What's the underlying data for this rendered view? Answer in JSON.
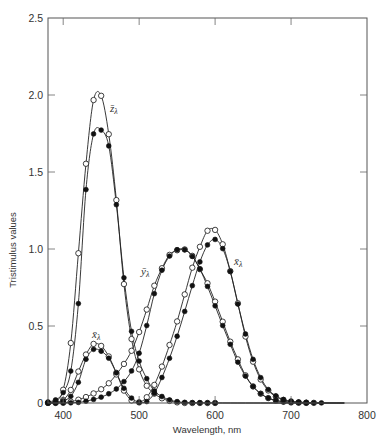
{
  "chart_data": {
    "type": "line",
    "title": "",
    "xlabel": "Wavelength, nm",
    "ylabel": "Tristimulus values",
    "xlim": [
      380,
      800
    ],
    "ylim": [
      0,
      2.5
    ],
    "xticks": [
      400,
      500,
      600,
      700,
      800
    ],
    "xtick_labels": [
      "400",
      "500",
      "600",
      "700",
      "800"
    ],
    "yticks": [
      0,
      0.5,
      1.0,
      1.5,
      2.0,
      2.5
    ],
    "ytick_labels": [
      "0",
      "0.5",
      "1.0",
      "1.5",
      "2.0",
      "2.5"
    ],
    "grid": false,
    "legend": "none (curves labeled inline)",
    "annotations": [
      {
        "text": "z̄λ",
        "x": 462,
        "y": 1.93
      },
      {
        "text": "ȳλ",
        "x": 517,
        "y": 0.95
      },
      {
        "text": "x̄λ",
        "x": 610,
        "y": 0.96
      },
      {
        "text": "x̄λ",
        "x": 444,
        "y": 0.42
      }
    ],
    "x": [
      380,
      390,
      400,
      410,
      420,
      430,
      440,
      450,
      460,
      470,
      480,
      490,
      500,
      510,
      520,
      530,
      540,
      550,
      560,
      570,
      580,
      590,
      600,
      610,
      620,
      630,
      640,
      650,
      660,
      670,
      680,
      690,
      700,
      710,
      720,
      730,
      740,
      750,
      760,
      770
    ],
    "series": [
      {
        "name": "x̄λ (2°, filled markers)",
        "marker": "filled",
        "values": [
          0.0014,
          0.0042,
          0.0143,
          0.0435,
          0.1344,
          0.2839,
          0.3483,
          0.3362,
          0.2908,
          0.1954,
          0.0956,
          0.032,
          0.0049,
          0.0093,
          0.0633,
          0.1655,
          0.2904,
          0.4334,
          0.5945,
          0.7621,
          0.9163,
          1.0263,
          1.0622,
          1.0026,
          0.8544,
          0.6424,
          0.4479,
          0.2835,
          0.1649,
          0.0874,
          0.0468,
          0.0227,
          0.0114,
          0.0058,
          0.0029,
          0.0014,
          0.0007,
          0.0003,
          0.0002,
          0.0001
        ]
      },
      {
        "name": "ȳλ (2°, filled markers)",
        "marker": "filled",
        "values": [
          0.0,
          0.0001,
          0.0004,
          0.0012,
          0.004,
          0.0116,
          0.023,
          0.038,
          0.06,
          0.091,
          0.139,
          0.208,
          0.323,
          0.503,
          0.71,
          0.862,
          0.954,
          0.995,
          0.995,
          0.952,
          0.87,
          0.757,
          0.631,
          0.503,
          0.381,
          0.265,
          0.175,
          0.107,
          0.061,
          0.032,
          0.017,
          0.0082,
          0.0041,
          0.0021,
          0.001,
          0.0005,
          0.0002,
          0.0001,
          0.0001,
          0.0
        ]
      },
      {
        "name": "z̄λ (2°, filled markers)",
        "marker": "filled",
        "values": [
          0.0065,
          0.0201,
          0.0679,
          0.2074,
          0.6456,
          1.3856,
          1.7471,
          1.7721,
          1.6692,
          1.2876,
          0.813,
          0.4652,
          0.272,
          0.1582,
          0.0782,
          0.0422,
          0.0203,
          0.0087,
          0.0039,
          0.0021,
          0.0017,
          0.0011,
          0.0008,
          0.0003,
          0.0002,
          0,
          0,
          0,
          0,
          0,
          0,
          0,
          0,
          0,
          0,
          0,
          0,
          0,
          0,
          0
        ]
      },
      {
        "name": "x̄λ (10°, open markers)",
        "marker": "open",
        "values": [
          0.0002,
          0.0024,
          0.0191,
          0.0847,
          0.2045,
          0.3147,
          0.3837,
          0.3707,
          0.3023,
          0.1956,
          0.0805,
          0.0162,
          0.0038,
          0.0375,
          0.1177,
          0.2365,
          0.3768,
          0.5298,
          0.7052,
          0.8787,
          1.0142,
          1.1185,
          1.124,
          1.0305,
          0.8563,
          0.6475,
          0.4316,
          0.2683,
          0.1526,
          0.0813,
          0.0409,
          0.0199,
          0.0096,
          0.0046,
          0.0022,
          0.001,
          0.0005,
          0.0003,
          0.0001,
          0.0001
        ]
      },
      {
        "name": "ȳλ (10°, open markers)",
        "marker": "open",
        "values": [
          0.0,
          0.0003,
          0.002,
          0.0088,
          0.0214,
          0.0387,
          0.0621,
          0.0895,
          0.1282,
          0.1852,
          0.2536,
          0.3391,
          0.4608,
          0.6067,
          0.7618,
          0.8752,
          0.962,
          0.9918,
          0.9973,
          0.9555,
          0.8689,
          0.7774,
          0.6583,
          0.528,
          0.3981,
          0.2835,
          0.1798,
          0.1076,
          0.0603,
          0.0318,
          0.0159,
          0.0077,
          0.0037,
          0.0018,
          0.0008,
          0.0004,
          0.0002,
          0.0001,
          0.0,
          0.0
        ]
      },
      {
        "name": "z̄λ (10°, open markers)",
        "marker": "open",
        "values": [
          0.0007,
          0.0105,
          0.086,
          0.3894,
          0.9725,
          1.5535,
          1.9673,
          1.9948,
          1.7454,
          1.3176,
          0.7721,
          0.4153,
          0.2185,
          0.112,
          0.0607,
          0.0305,
          0.0137,
          0.004,
          0,
          0,
          0,
          0,
          0,
          0,
          0,
          0,
          0,
          0,
          0,
          0,
          0,
          0,
          0,
          0,
          0,
          0,
          0,
          0,
          0,
          0
        ]
      }
    ]
  },
  "labels": {
    "zbar": "z̄",
    "ybar": "ȳ",
    "xbar": "x̄",
    "lambda": "λ"
  }
}
